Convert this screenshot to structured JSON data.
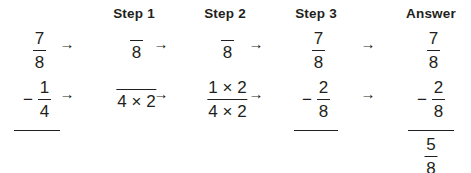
{
  "document": {
    "title": "Fraction Subtraction Step-by-Step Worksheet",
    "arrow_glyph": "→",
    "minus_glyph": "−",
    "times_glyph": "×"
  },
  "columns": [
    {
      "id": "problem",
      "header": "",
      "left": 6,
      "width": 62,
      "rule_width": 46,
      "rows": [
        {
          "sign": "",
          "numerator": "7",
          "denominator": "8"
        },
        {
          "sign": "−",
          "numerator": "1",
          "denominator": "4"
        }
      ],
      "result": null
    },
    {
      "id": "step-1",
      "header": "Step 1",
      "left": 86,
      "width": 96,
      "rule_width": 0,
      "rows": [
        {
          "sign": "",
          "numerator": "",
          "denominator": "8"
        },
        {
          "sign": "",
          "numerator": "",
          "denominator": "4 × 2"
        }
      ],
      "result": null
    },
    {
      "id": "step-2",
      "header": "Step 2",
      "left": 177,
      "width": 96,
      "rule_width": 0,
      "rows": [
        {
          "sign": "",
          "numerator": "",
          "denominator": "8"
        },
        {
          "sign": "",
          "numerator": "1 × 2",
          "denominator": "4 × 2"
        }
      ],
      "result": null
    },
    {
      "id": "step-3",
      "header": "Step 3",
      "left": 274,
      "width": 84,
      "rule_width": 44,
      "rows": [
        {
          "sign": "",
          "numerator": "7",
          "denominator": "8"
        },
        {
          "sign": "−",
          "numerator": "2",
          "denominator": "8"
        }
      ],
      "result": null
    },
    {
      "id": "answer",
      "header": "Answer",
      "left": 394,
      "width": 74,
      "rule_width": 46,
      "rows": [
        {
          "sign": "",
          "numerator": "7",
          "denominator": "8"
        },
        {
          "sign": "−",
          "numerator": "2",
          "denominator": "8"
        }
      ],
      "result": {
        "numerator": "5",
        "denominator": "8"
      }
    }
  ],
  "arrows": [
    {
      "id": "arrow-1-top",
      "left": 56,
      "top": 36,
      "glyph": "→"
    },
    {
      "id": "arrow-1-bottom",
      "left": 56,
      "top": 86,
      "glyph": "→"
    },
    {
      "id": "arrow-2-top",
      "left": 150,
      "top": 36,
      "glyph": "→"
    },
    {
      "id": "arrow-2-bottom",
      "left": 150,
      "top": 86,
      "glyph": "→"
    },
    {
      "id": "arrow-3-top",
      "left": 245,
      "top": 36,
      "glyph": "→"
    },
    {
      "id": "arrow-3-bottom",
      "left": 245,
      "top": 86,
      "glyph": "→"
    },
    {
      "id": "arrow-4-top",
      "left": 357,
      "top": 36,
      "glyph": "→"
    },
    {
      "id": "arrow-4-bottom",
      "left": 357,
      "top": 86,
      "glyph": "→"
    }
  ],
  "colors": {
    "ink": "#231f20",
    "background": "#ffffff"
  }
}
